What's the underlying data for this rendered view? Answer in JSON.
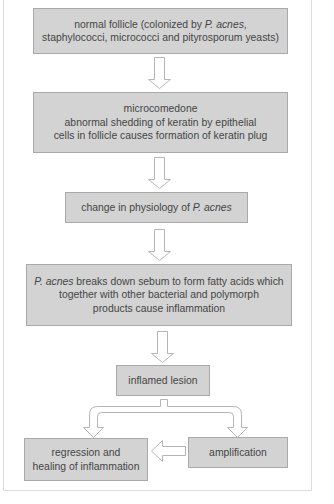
{
  "diagram": {
    "nodes": [
      {
        "id": "normal-follicle",
        "lines": [
          {
            "pre": "normal follicle (colonized by ",
            "em": "P. acnes",
            "post": ","
          },
          {
            "pre": "staphylococci, micrococci and pityrosporum yeasts)",
            "em": "",
            "post": ""
          }
        ]
      },
      {
        "id": "microcomedone",
        "lines": [
          {
            "pre": "microcomedone",
            "em": "",
            "post": ""
          },
          {
            "pre": "abnormal shedding of keratin by epithelial",
            "em": "",
            "post": ""
          },
          {
            "pre": "cells in follicle causes formation of keratin plug",
            "em": "",
            "post": ""
          }
        ]
      },
      {
        "id": "physiology-change",
        "lines": [
          {
            "pre": "change in physiology of ",
            "em": "P. acnes",
            "post": ""
          }
        ]
      },
      {
        "id": "sebum-breakdown",
        "lines": [
          {
            "pre": "",
            "em": "P. acnes",
            "post": " breaks down sebum to form fatty acids which"
          },
          {
            "pre": "together with other bacterial and polymorph",
            "em": "",
            "post": ""
          },
          {
            "pre": "products cause inflammation",
            "em": "",
            "post": ""
          }
        ]
      },
      {
        "id": "inflamed-lesion",
        "lines": [
          {
            "pre": "inflamed lesion",
            "em": "",
            "post": ""
          }
        ]
      },
      {
        "id": "regression",
        "lines": [
          {
            "pre": "regression and",
            "em": "",
            "post": ""
          },
          {
            "pre": "healing of inflammation",
            "em": "",
            "post": ""
          }
        ]
      },
      {
        "id": "amplification",
        "lines": [
          {
            "pre": "amplification",
            "em": "",
            "post": ""
          }
        ]
      }
    ],
    "edges": [
      {
        "from": "normal-follicle",
        "to": "microcomedone"
      },
      {
        "from": "microcomedone",
        "to": "physiology-change"
      },
      {
        "from": "physiology-change",
        "to": "sebum-breakdown"
      },
      {
        "from": "sebum-breakdown",
        "to": "inflamed-lesion"
      },
      {
        "from": "inflamed-lesion",
        "to": "regression"
      },
      {
        "from": "inflamed-lesion",
        "to": "amplification"
      },
      {
        "from": "amplification",
        "to": "regression"
      }
    ],
    "colors": {
      "box_fill": "#d3d3d3",
      "box_border": "#a9a9a9",
      "text": "#454545",
      "arrow_stroke": "#b5b5b5"
    }
  }
}
